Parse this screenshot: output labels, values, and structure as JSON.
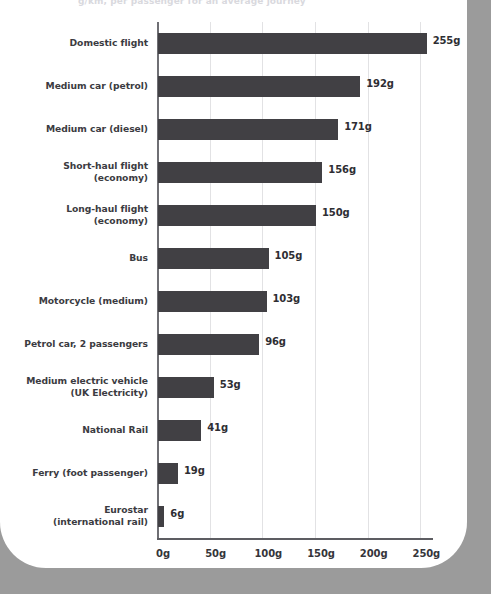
{
  "headline": "g/km, per passenger for an average journey",
  "chart_data": {
    "type": "bar",
    "orientation": "horizontal",
    "title": "g/km, per passenger for an average journey",
    "xlabel": "",
    "ylabel": "",
    "xlim": [
      0,
      262
    ],
    "grid": true,
    "legend": "none",
    "bar_color": "#414044",
    "gridline_color": "#e2e2e4",
    "axis_color": "#5d5d62",
    "value_suffix": "g",
    "x_ticks": [
      {
        "value": 0,
        "label": "0g"
      },
      {
        "value": 50,
        "label": "50g"
      },
      {
        "value": 100,
        "label": "100g"
      },
      {
        "value": 150,
        "label": "150g"
      },
      {
        "value": 200,
        "label": "200g"
      },
      {
        "value": 250,
        "label": "250g"
      }
    ],
    "categories": [
      "Domestic flight",
      "Medium car (petrol)",
      "Medium car (diesel)",
      "Short-haul flight (economy)",
      "Long-haul flight (economy)",
      "Bus",
      "Motorcycle (medium)",
      "Petrol car, 2 passengers",
      "Medium electric vehicle (UK Electricity)",
      "National Rail",
      "Ferry (foot passenger)",
      "Eurostar (international rail)"
    ],
    "values": [
      255,
      192,
      171,
      156,
      150,
      105,
      103,
      96,
      53,
      41,
      19,
      6
    ],
    "value_labels": [
      "255g",
      "192g",
      "171g",
      "156g",
      "150g",
      "105g",
      "103g",
      "96g",
      "53g",
      "41g",
      "19g",
      "6g"
    ],
    "category_lines": [
      [
        "Domestic flight"
      ],
      [
        "Medium car (petrol)"
      ],
      [
        "Medium car (diesel)"
      ],
      [
        "Short-haul flight",
        "(economy)"
      ],
      [
        "Long-haul flight",
        "(economy)"
      ],
      [
        "Bus"
      ],
      [
        "Motorcycle (medium)"
      ],
      [
        "Petrol car, 2 passengers"
      ],
      [
        "Medium electric vehicle",
        "(UK Electricity)"
      ],
      [
        "National Rail"
      ],
      [
        "Ferry (foot passenger)"
      ],
      [
        "Eurostar",
        "(international rail)"
      ]
    ]
  }
}
